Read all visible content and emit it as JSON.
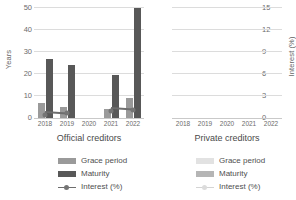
{
  "chart_data": {
    "type": "bar",
    "title": "",
    "categories": [
      "2018",
      "2019",
      "2020",
      "2021",
      "2022"
    ],
    "panels": [
      {
        "name": "official",
        "title": "Official creditors",
        "series": [
          {
            "name": "Grace period",
            "key": "grace",
            "values": [
              7,
              5,
              0,
              4,
              9
            ],
            "axis": "left"
          },
          {
            "name": "Maturity",
            "key": "maturity",
            "values": [
              27,
              24,
              0,
              19.5,
              50
            ],
            "axis": "left"
          },
          {
            "name": "Interest (%)",
            "key": "interest",
            "values": [
              0.8,
              1.0,
              null,
              1.3,
              1.5
            ],
            "axis": "right"
          }
        ]
      },
      {
        "name": "private",
        "title": "Private creditors",
        "series": [
          {
            "name": "Grace period",
            "key": "grace",
            "values": [
              null,
              null,
              null,
              null,
              null
            ],
            "axis": "left"
          },
          {
            "name": "Maturity",
            "key": "maturity",
            "values": [
              null,
              null,
              null,
              null,
              null
            ],
            "axis": "left"
          },
          {
            "name": "Interest (%)",
            "key": "interest",
            "values": [
              null,
              null,
              null,
              null,
              null
            ],
            "axis": "right"
          }
        ]
      }
    ],
    "ylabel": "Years",
    "ylabel_secondary": "Interest (%)",
    "xlabel": "",
    "ylim": [
      0,
      50
    ],
    "ylim_secondary": [
      0,
      15
    ],
    "yticks": [
      0,
      10,
      20,
      30,
      40,
      50
    ],
    "yticks_secondary": [
      0,
      3,
      6,
      9,
      12,
      15
    ],
    "grid": true,
    "legend_position": "bottom"
  },
  "axes": {
    "left_title": "Years",
    "right_title": "Interest (%)",
    "left_ticks": [
      "0",
      "10",
      "20",
      "30",
      "40",
      "50"
    ],
    "right_ticks": [
      "0",
      "3",
      "6",
      "9",
      "12",
      "15"
    ]
  },
  "panels": {
    "official": {
      "title": "Official creditors",
      "xticks": [
        "2018",
        "2019",
        "2020",
        "2021",
        "2022"
      ]
    },
    "private": {
      "title": "Private creditors",
      "xticks": [
        "2018",
        "2019",
        "2020",
        "2021",
        "2022"
      ]
    }
  },
  "legend": {
    "official": {
      "grace": "Grace period",
      "maturity": "Maturity",
      "interest": "Interest (%)"
    },
    "private": {
      "grace": "Grace period",
      "maturity": "Maturity",
      "interest": "Interest (%)"
    }
  },
  "colors": {
    "grace_official": "#9a9a9a",
    "maturity_official": "#585858",
    "interest_official": "#757575",
    "grace_private": "#e2e2e2",
    "maturity_private": "#b5b5b5",
    "interest_private": "#d4d4d4",
    "gridline": "#dcdcdc",
    "axis": "#c9c9c9",
    "text": "#595959"
  }
}
